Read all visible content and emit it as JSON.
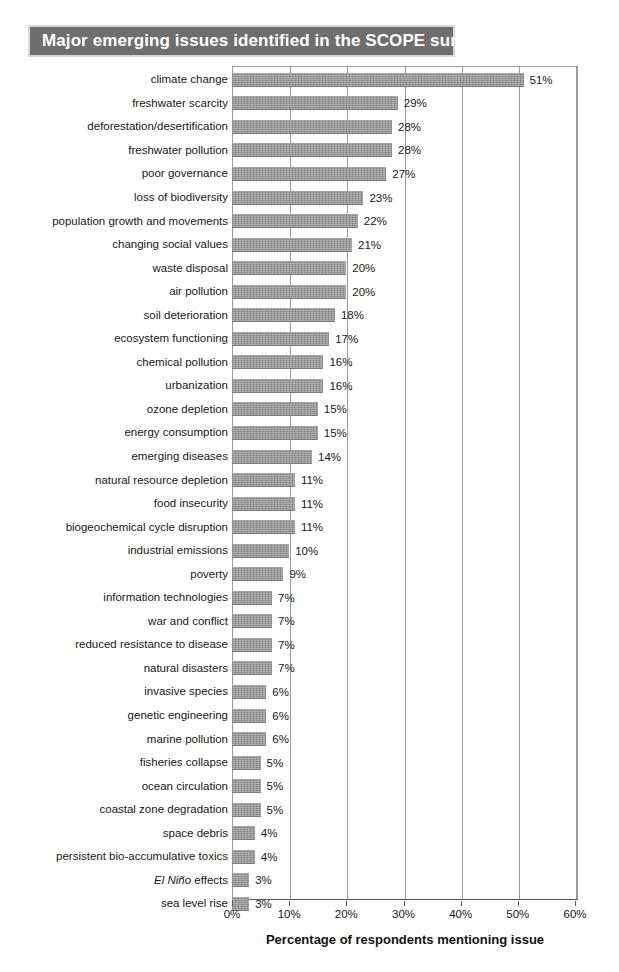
{
  "title": "Major emerging issues identified in the SCOPE survey",
  "colors": {
    "title_bar_background": "#6e6e6e",
    "title_text": "#ffffff",
    "bar_fill": "#8e8e8e",
    "gridline": "#9a9a9a",
    "axis_line": "#5a5a5a",
    "page_background": "#ffffff",
    "text": "#171717"
  },
  "chart_data": {
    "type": "bar",
    "orientation": "horizontal",
    "title": "Major emerging issues identified in the SCOPE survey",
    "xlabel": "Percentage of respondents mentioning issue",
    "ylabel": "",
    "xlim": [
      0,
      60
    ],
    "xticks": [
      0,
      10,
      20,
      30,
      40,
      50,
      60
    ],
    "xtick_labels": [
      "0%",
      "10%",
      "20%",
      "30%",
      "40%",
      "50%",
      "60%"
    ],
    "grid": "vertical",
    "legend": "none",
    "value_label_suffix": "%",
    "categories": [
      "climate change",
      "freshwater scarcity",
      "deforestation/desertification",
      "freshwater pollution",
      "poor governance",
      "loss of biodiversity",
      "population growth and movements",
      "changing social values",
      "waste disposal",
      "air pollution",
      "soil deterioration",
      "ecosystem functioning",
      "chemical pollution",
      "urbanization",
      "ozone depletion",
      "energy consumption",
      "emerging diseases",
      "natural resource depletion",
      "food insecurity",
      "biogeochemical cycle disruption",
      "industrial emissions",
      "poverty",
      "information technologies",
      "war and conflict",
      "reduced resistance to disease",
      "natural disasters",
      "invasive species",
      "genetic engineering",
      "marine pollution",
      "fisheries collapse",
      "ocean circulation",
      "coastal zone degradation",
      "space debris",
      "persistent bio-accumulative toxics",
      "El Niño effects",
      "sea level rise"
    ],
    "values": [
      51,
      29,
      28,
      28,
      27,
      23,
      22,
      21,
      20,
      20,
      18,
      17,
      16,
      16,
      15,
      15,
      14,
      11,
      11,
      11,
      10,
      9,
      7,
      7,
      7,
      7,
      6,
      6,
      6,
      5,
      5,
      5,
      4,
      4,
      3,
      3
    ],
    "value_labels": [
      "51%",
      "29%",
      "28%",
      "28%",
      "27%",
      "23%",
      "22%",
      "21%",
      "20%",
      "20%",
      "18%",
      "17%",
      "16%",
      "16%",
      "15%",
      "15%",
      "14%",
      "11%",
      "11%",
      "11%",
      "10%",
      "9%",
      "7%",
      "7%",
      "7%",
      "7%",
      "6%",
      "6%",
      "6%",
      "5%",
      "5%",
      "5%",
      "4%",
      "4%",
      "3%",
      "3%"
    ],
    "italic_categories": [
      "El Niño effects"
    ]
  }
}
